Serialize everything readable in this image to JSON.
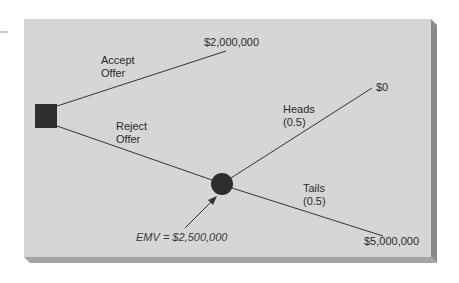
{
  "diagram": {
    "type": "decision-tree",
    "colors": {
      "panel_face": "#d6d6d6",
      "panel_side": "#8a8a8a",
      "panel_bottom": "#a2a2a2",
      "node_fill": "#2e2e2e",
      "line": "#333333",
      "text": "#2a2a2a"
    },
    "decision_node": {
      "shape": "square",
      "label": ""
    },
    "chance_node": {
      "shape": "circle",
      "annotation": "EMV = $2,500,000"
    },
    "branches": [
      {
        "id": "accept",
        "label_line1": "Accept",
        "label_line2": "Offer",
        "payoff": "$2,000,000"
      },
      {
        "id": "reject",
        "label_line1": "Reject",
        "label_line2": "Offer",
        "payoff": ""
      }
    ],
    "chance_branches": [
      {
        "id": "heads",
        "label_line1": "Heads",
        "label_line2": "(0.5)",
        "payoff": "$0"
      },
      {
        "id": "tails",
        "label_line1": "Tails",
        "label_line2": "(0.5)",
        "payoff": "$5,000,000"
      }
    ]
  }
}
